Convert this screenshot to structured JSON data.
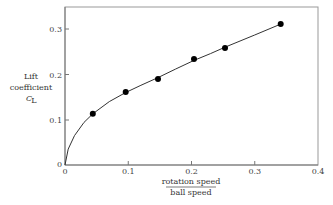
{
  "chart_data": {
    "type": "scatter",
    "title": "",
    "xlabel": {
      "numerator": "rotation speed",
      "denominator": "ball speed"
    },
    "ylabel": [
      "Lift",
      "coefficient",
      "C_L"
    ],
    "xlim": [
      0,
      0.4
    ],
    "ylim": [
      0,
      0.35
    ],
    "x_ticks": [
      "0",
      "0.1",
      "0.2",
      "0.3",
      "0.4"
    ],
    "x_tick_values": [
      0,
      0.1,
      0.2,
      0.3,
      0.4
    ],
    "y_ticks": [
      "0",
      "0.1",
      "0.2",
      "0.3"
    ],
    "y_tick_values": [
      0,
      0.1,
      0.2,
      0.3
    ],
    "grid": false,
    "legend": null,
    "series": [
      {
        "name": "measured",
        "marker": "filled-circle",
        "x": [
          0.044,
          0.096,
          0.147,
          0.204,
          0.253,
          0.341
        ],
        "y": [
          0.113,
          0.161,
          0.19,
          0.234,
          0.258,
          0.311
        ]
      },
      {
        "name": "fit curve",
        "style": "line",
        "x": [
          0,
          0.005,
          0.015,
          0.03,
          0.044,
          0.07,
          0.096,
          0.12,
          0.147,
          0.175,
          0.204,
          0.23,
          0.253,
          0.3,
          0.341
        ],
        "y": [
          0,
          0.035,
          0.065,
          0.094,
          0.113,
          0.14,
          0.16,
          0.176,
          0.193,
          0.212,
          0.231,
          0.246,
          0.26,
          0.287,
          0.311
        ]
      }
    ]
  },
  "labels": {
    "y_line1": "Lift",
    "y_line2": "coefficient",
    "y_line3_main": "C",
    "y_line3_sub": "L",
    "x_num": "rotation speed",
    "x_den": "ball speed",
    "x_ticks": [
      "0",
      "0.1",
      "0.2",
      "0.3",
      "0.4"
    ],
    "y_ticks": [
      "0",
      "0.1",
      "0.2",
      "0.3"
    ]
  }
}
